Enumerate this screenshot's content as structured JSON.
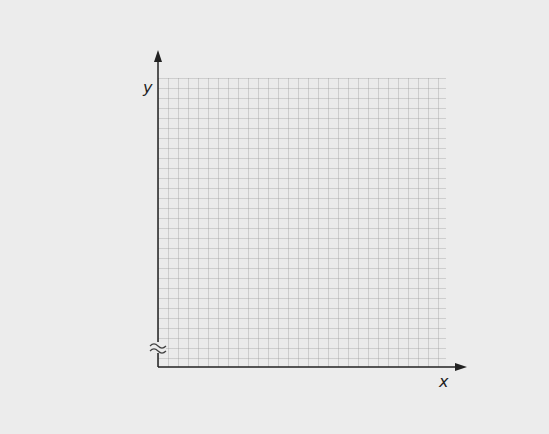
{
  "diagram": {
    "type": "blank coordinate grid",
    "x_axis_label": "x",
    "y_axis_label": "y",
    "axis_break_symbol": "≈",
    "grid_cell_px": 10,
    "colors": {
      "background": "#ececec",
      "grid": "#c8c8c8",
      "axis": "#222222"
    }
  }
}
